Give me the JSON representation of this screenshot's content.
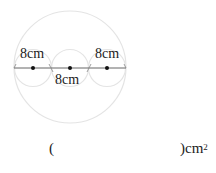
{
  "figure": {
    "labels": {
      "left": "8cm",
      "middle": "8cm",
      "right": "8cm"
    }
  },
  "answer": {
    "open_paren": "(",
    "close_paren_unit": ")cm",
    "superscript": "2"
  }
}
